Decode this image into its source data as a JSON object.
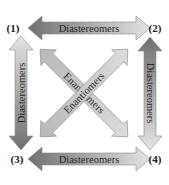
{
  "nodes": [
    {
      "id": "1",
      "label": "(1)"
    },
    {
      "id": "2",
      "label": "(2)"
    },
    {
      "id": "3",
      "label": "(3)"
    },
    {
      "id": "4",
      "label": "(4)"
    }
  ],
  "relations": {
    "top": "Diastereomers",
    "bottom": "Diastereomers",
    "left": "Diastereomers",
    "right": "Diastereomers",
    "diag_1_4": "Enantiomers",
    "diag_2_3": "Enantiomers"
  },
  "colors": {
    "dark": "#7a7a7a",
    "light": "#d8d8d8",
    "outline": "#9a9a9a"
  }
}
